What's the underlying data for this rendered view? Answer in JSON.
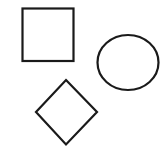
{
  "canvas": {
    "width": 168,
    "height": 149,
    "background": "#ffffff"
  },
  "style": {
    "stroke": "#1a1a1a",
    "stroke_width": 2.2,
    "fill": "none"
  },
  "shapes": [
    {
      "type": "square",
      "label": "square",
      "x": 22.5,
      "y": 8.5,
      "width": 51,
      "height": 52.5
    },
    {
      "type": "circle",
      "label": "ellipse",
      "cx": 128,
      "cy": 62.5,
      "rx": 30.5,
      "ry": 27.5
    },
    {
      "type": "diamond",
      "label": "diamond",
      "points": [
        [
          66,
          80
        ],
        [
          97,
          112
        ],
        [
          66,
          144.5
        ],
        [
          36,
          112
        ]
      ]
    }
  ]
}
